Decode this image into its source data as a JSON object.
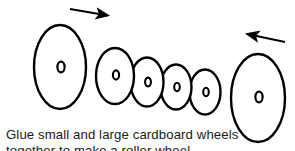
{
  "figure": {
    "background_color": "#ffffff",
    "stroke_color": "#000000",
    "fill_color": "#ffffff",
    "arrows": [
      {
        "name": "left-arrow",
        "direction": "right",
        "glyph": "arrow-right-icon",
        "x1": 70,
        "y1": 9,
        "x2": 112,
        "y2": 16
      },
      {
        "name": "right-arrow",
        "direction": "left",
        "glyph": "arrow-left-icon",
        "x1": 285,
        "y1": 42,
        "x2": 243,
        "y2": 33
      }
    ],
    "wheels": [
      {
        "name": "wheel-1-large",
        "size": "large",
        "cx": 60,
        "cy": 66,
        "rx": 26,
        "ry": 42,
        "hub_rx": 3.6,
        "hub_ry": 5.2,
        "rim_offset": 7
      },
      {
        "name": "wheel-2-medium",
        "size": "medium",
        "cx": 113,
        "cy": 76,
        "rx": 19,
        "ry": 28,
        "hub_rx": 3.2,
        "hub_ry": 4.6,
        "rim_offset": 0
      },
      {
        "name": "wheel-3-small",
        "size": "small",
        "cx": 146,
        "cy": 82,
        "rx": 16,
        "ry": 24,
        "hub_rx": 2.9,
        "hub_ry": 4.2,
        "rim_offset": 0
      },
      {
        "name": "wheel-4-small",
        "size": "small",
        "cx": 175,
        "cy": 87,
        "rx": 15,
        "ry": 22,
        "hub_rx": 2.7,
        "hub_ry": 4.0,
        "rim_offset": 0
      },
      {
        "name": "wheel-5-small",
        "size": "small",
        "cx": 205,
        "cy": 92,
        "rx": 15,
        "ry": 22,
        "hub_rx": 2.7,
        "hub_ry": 4.0,
        "rim_offset": 0
      },
      {
        "name": "wheel-6-large",
        "size": "large",
        "cx": 258,
        "cy": 98,
        "rx": 27,
        "ry": 44,
        "hub_rx": 3.6,
        "hub_ry": 5.2,
        "rim_offset": 8
      }
    ],
    "hub_label": "o"
  },
  "caption": {
    "line1": "Glue small and large cardboard wheels",
    "line2": "together to make a roller wheel"
  }
}
